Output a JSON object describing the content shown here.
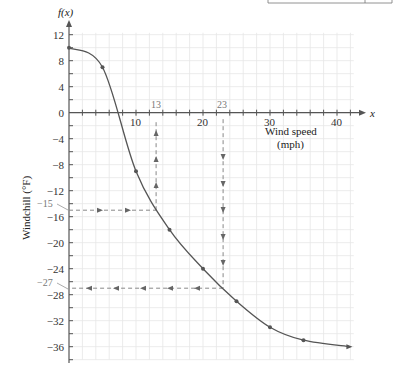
{
  "chart_data": {
    "type": "line",
    "title": "",
    "xlabel": "Wind speed (mph)",
    "xlabel_lines": [
      "Wind speed",
      "(mph)"
    ],
    "ylabel": "Windchill (°F)",
    "x_axis_symbol": "x",
    "y_axis_symbol": "f(x)",
    "xlim": [
      0,
      42
    ],
    "ylim": [
      -38,
      12
    ],
    "x_ticks": [
      10,
      20,
      30,
      40
    ],
    "x_tick_labels": [
      "10",
      "20",
      "30",
      "40"
    ],
    "y_ticks": [
      12,
      8,
      4,
      0,
      -4,
      -8,
      -12,
      -16,
      -20,
      -24,
      -28,
      -32,
      -36
    ],
    "y_tick_labels": [
      "12",
      "8",
      "4",
      "0",
      "−4",
      "−8",
      "−12",
      "−16",
      "−20",
      "−24",
      "−28",
      "−32",
      "−36"
    ],
    "grid": true,
    "series": [
      {
        "name": "Windchill",
        "x": [
          0,
          5,
          10,
          15,
          20,
          25,
          30,
          35,
          42
        ],
        "values": [
          10,
          7,
          -9,
          -18,
          -24,
          -29,
          -33,
          -35,
          -36
        ]
      }
    ],
    "annotations": [
      {
        "type": "dashed-path",
        "from": [
          0,
          -15
        ],
        "to": [
          13,
          -15
        ],
        "direction": "right"
      },
      {
        "type": "dashed-path",
        "from": [
          13,
          -15
        ],
        "to": [
          13,
          -1
        ],
        "direction": "up"
      },
      {
        "type": "dashed-path",
        "from": [
          23,
          -1
        ],
        "to": [
          23,
          -27
        ],
        "direction": "down"
      },
      {
        "type": "dashed-path",
        "from": [
          23,
          -27
        ],
        "to": [
          0,
          -27
        ],
        "direction": "left"
      },
      {
        "type": "label",
        "text": "13",
        "at": [
          13,
          0
        ]
      },
      {
        "type": "label",
        "text": "23",
        "at": [
          23,
          0
        ]
      },
      {
        "type": "label",
        "text": "−15",
        "at": [
          0,
          -15
        ]
      },
      {
        "type": "label",
        "text": "−27",
        "at": [
          0,
          -27
        ]
      }
    ]
  },
  "labels": {
    "y_symbol": "f(x)",
    "x_symbol": "x",
    "xlabel_line1": "Wind speed",
    "xlabel_line2": "(mph)",
    "ylabel": "Windchill (°F)",
    "ann_13": "13",
    "ann_23": "23",
    "ann_m15": "−15",
    "ann_m27": "−27",
    "origin": "0"
  },
  "colors": {
    "curve": "#555555",
    "axis": "#555555",
    "grid": "#e6e6e6",
    "dashed": "#888888",
    "text": "#333333"
  }
}
